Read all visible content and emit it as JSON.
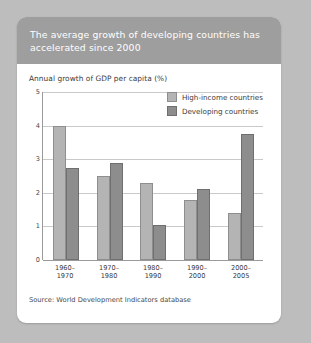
{
  "card": {
    "title": "The average growth of developing countries has accelerated since 2000",
    "source": "Source: World Development Indicators database"
  },
  "chart_data": {
    "type": "bar",
    "title": "The average growth of developing countries has accelerated since 2000",
    "subtitle": "Annual growth of GDP per capita (%)",
    "xlabel": "",
    "ylabel": "Annual growth of GDP per capita (%)",
    "ylim": [
      0,
      5
    ],
    "yticks": [
      "0",
      "1",
      "2",
      "3",
      "4",
      "5"
    ],
    "grid": true,
    "legend_position": "top-right",
    "categories": [
      "1960–1970",
      "1970–1980",
      "1980–1990",
      "1990–2000",
      "2000–2005"
    ],
    "series": [
      {
        "name": "High-income countries",
        "color": "#b4b4b4",
        "values": [
          4.0,
          2.5,
          2.3,
          1.8,
          1.4
        ]
      },
      {
        "name": "Developing countries",
        "color": "#8d8d8d",
        "values": [
          2.75,
          2.9,
          1.05,
          2.1,
          3.75
        ]
      }
    ],
    "source": "Source: World Development Indicators database"
  }
}
